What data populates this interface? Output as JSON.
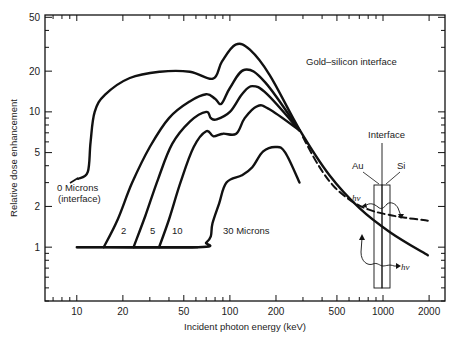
{
  "chart_data": {
    "type": "line",
    "title": "",
    "xlabel": "Incident photon energy (keV)",
    "ylabel": "Relative dose enhancement",
    "xscale": "log",
    "yscale": "log",
    "xlim": [
      6.2,
      2540
    ],
    "ylim": [
      0.4,
      52
    ],
    "grid": false,
    "x_ticks": [
      10,
      20,
      50,
      100,
      200,
      500,
      1000,
      2000
    ],
    "x_tick_labels": [
      "10",
      "20",
      "50",
      "100",
      "200",
      "500",
      "1000",
      "2000"
    ],
    "y_ticks": [
      1,
      2,
      5,
      10,
      20,
      50
    ],
    "y_tick_labels": [
      "1",
      "2",
      "5",
      "10",
      "20",
      "50"
    ],
    "annotations": {
      "panel_label": "Gold–silicon interface",
      "interface_label": "Interface",
      "au_label": "Au",
      "si_label": "Si",
      "hv_upper": "hν",
      "hv_lower": "hν"
    },
    "series": [
      {
        "name": "0 Microns",
        "label_line1": "0 Microns",
        "label_line2": "(interface)",
        "style": "solid",
        "x": [
          10.2,
          11.8,
          12.3,
          13.1,
          15.3,
          22.2,
          34.9,
          54.8,
          77.5,
          88.7,
          109,
          135,
          182,
          285,
          447,
          702,
          1110,
          1960
        ],
        "y": [
          3.2,
          3.6,
          6.0,
          10.0,
          13.4,
          17.8,
          19.8,
          19.8,
          17.6,
          23.5,
          31.4,
          28.8,
          18.7,
          7.4,
          3.4,
          1.94,
          1.29,
          0.87
        ]
      },
      {
        "name": "2",
        "label": "2",
        "style": "solid",
        "x": [
          15.0,
          18.5,
          23,
          30,
          40,
          55,
          70,
          80,
          88,
          100,
          125,
          170,
          285
        ],
        "y": [
          1.0,
          1.6,
          3.0,
          5.5,
          9.0,
          12.0,
          13.5,
          12.5,
          11.5,
          15.0,
          20.5,
          16.5,
          7.3
        ]
      },
      {
        "name": "5",
        "label": "5",
        "style": "solid",
        "x": [
          23.5,
          28,
          34,
          42,
          55,
          70,
          75,
          82,
          100,
          120,
          140,
          175,
          285
        ],
        "y": [
          1.0,
          1.7,
          3.2,
          5.8,
          8.5,
          10.0,
          9.0,
          8.8,
          10.0,
          13.5,
          15.5,
          13.5,
          7.3
        ]
      },
      {
        "name": "10",
        "label": "10",
        "style": "solid",
        "x": [
          34.5,
          40,
          48,
          58,
          70,
          78,
          90,
          110,
          125,
          150,
          180,
          285
        ],
        "y": [
          1.0,
          1.6,
          3.1,
          5.5,
          7.2,
          6.6,
          6.9,
          6.9,
          9.0,
          11.0,
          10.5,
          7.3
        ]
      },
      {
        "name": "30 Microns",
        "label": "30 Microns",
        "style": "solid",
        "x": [
          10.0,
          62,
          70,
          75,
          77,
          85,
          95,
          120,
          140,
          165,
          200,
          230,
          285
        ],
        "y": [
          1.0,
          1.0,
          1.08,
          1.2,
          1.5,
          2.1,
          3.0,
          3.4,
          3.9,
          5.1,
          5.5,
          5.0,
          3.0
        ]
      },
      {
        "name": "dashed (Si side)",
        "style": "dashed",
        "x": [
          300,
          380,
          480,
          620,
          800,
          1050,
          1400,
          1960
        ],
        "y": [
          6.5,
          4.0,
          2.8,
          2.2,
          1.9,
          1.75,
          1.65,
          1.57
        ]
      }
    ]
  }
}
